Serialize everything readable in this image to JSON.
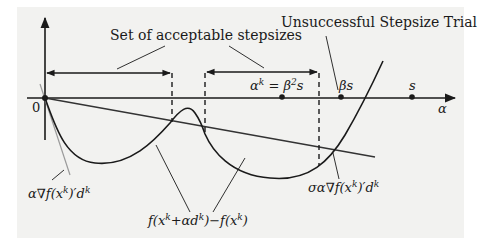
{
  "figure": {
    "background_color": "#f2f2f0",
    "ink_color": "#1a1a1a",
    "gray_line_color": "#9a9a9a",
    "labels": {
      "acceptable_set": "Set of acceptable stepsizes",
      "unsuccessful_trial": "Unsuccessful Stepsize Trial",
      "origin": "0",
      "alpha_axis": "α",
      "point_alpha_k": "αᵏ = β²s",
      "point_beta_s": "βs",
      "point_s": "s",
      "tangent_line": "α∇f(xᵏ)′dᵏ",
      "function_curve": "f(xᵏ+αdᵏ)−f(xᵏ)",
      "sufficient_decrease_line": "σα∇f(xᵏ)′dᵏ"
    },
    "label_parts": {
      "alpha_k_lhs": "α",
      "alpha_k_sup": "k",
      "alpha_k_eq": " = β",
      "alpha_k_sup2": "2",
      "alpha_k_rhs": "s",
      "beta_s": "βs",
      "s": "s",
      "tangent_main": "α∇f(x",
      "tangent_sup": "k",
      "tangent_mid": ")′d",
      "tangent_sup2": "k",
      "func_a": "f(x",
      "func_sup1": "k",
      "func_b": "+αd",
      "func_sup2": "k",
      "func_c": ")−f(x",
      "func_sup3": "k",
      "func_d": ")",
      "sigma_main": "σα∇f(x",
      "sigma_sup": "k",
      "sigma_mid": ")′d",
      "sigma_sup2": "k"
    },
    "points_on_axis": [
      "αᵏ = β²s",
      "βs",
      "s"
    ],
    "intervals": [
      {
        "name": "first-acceptable-interval",
        "from": "0",
        "to": "first crossing"
      },
      {
        "name": "second-acceptable-interval",
        "from": "second crossing",
        "to": "third crossing"
      }
    ]
  }
}
